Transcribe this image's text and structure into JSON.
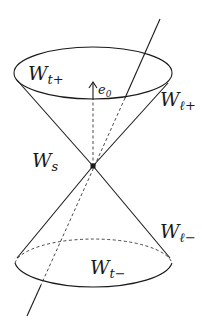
{
  "figure": {
    "type": "light-cone diagram",
    "labels": {
      "top_cap": {
        "main": "W",
        "sub": "t+"
      },
      "bottom_cap": {
        "main": "W",
        "sub": "t−"
      },
      "upper_side": {
        "main": "W",
        "sub": "ℓ+"
      },
      "lower_side": {
        "main": "W",
        "sub": "ℓ−"
      },
      "spacelike": {
        "main": "W",
        "sub": "s"
      },
      "vector": {
        "main": "e",
        "sub": "0"
      }
    },
    "colors": {
      "stroke": "#1a1a1a",
      "background": "#ffffff"
    }
  }
}
